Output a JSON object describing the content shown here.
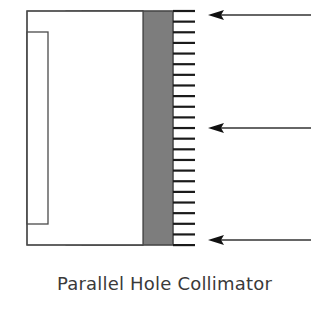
{
  "figure": {
    "caption": "Parallel Hole Collimator",
    "colors": {
      "background": "#ffffff",
      "outline": "#4a4a4a",
      "crystal_strip": "#8f8f8f",
      "septa_fill": "#c4c4c4",
      "holes": "#ffffff",
      "detector_block": "#7d7d7d",
      "ticks": "#1a1a1a",
      "arrows": "#333333"
    },
    "components": [
      {
        "name": "housing-outer-box",
        "x": 27,
        "y": 11,
        "w": 116,
        "h": 234
      },
      {
        "name": "housing-inner-box",
        "x": 27,
        "y": 32,
        "w": 21,
        "h": 192
      },
      {
        "name": "crystal-strip",
        "x": 66,
        "y": 11,
        "w": 16,
        "h": 234
      },
      {
        "name": "collimator-septa",
        "x": 82,
        "y": 11,
        "w": 61,
        "h": 234
      },
      {
        "name": "detector-block",
        "x": 143,
        "y": 11,
        "w": 30,
        "h": 234
      }
    ],
    "holes": {
      "count": 12,
      "first_tip_y": 11,
      "spacing": 21.27,
      "x_start": 82,
      "x_taper": 120,
      "x_tip": 143,
      "half_height": 5
    },
    "ticks": {
      "count": 23,
      "first_y": 11,
      "spacing": 10.64,
      "x_start": 173,
      "x_end": 195
    },
    "arrows": [
      {
        "y": 15,
        "tip_x": 208,
        "tail_x": 311
      },
      {
        "y": 128,
        "tip_x": 208,
        "tail_x": 311
      },
      {
        "y": 240,
        "tip_x": 208,
        "tail_x": 311
      }
    ]
  }
}
